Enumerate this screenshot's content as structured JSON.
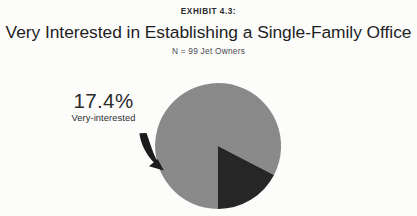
{
  "header": {
    "exhibit_label": "EXHIBIT 4.3:",
    "title": "Very Interested in Establishing a Single-Family Office",
    "sample_size": "N = 99 Jet Owners"
  },
  "callout": {
    "value": "17.4%",
    "name": "Very-interested"
  },
  "colors": {
    "slice_highlight": "#262626",
    "slice_remainder": "#8a8a8a",
    "background": "#fdfdfc",
    "text": "#222222",
    "leader": "#1c1c1c"
  },
  "chart_data": {
    "type": "pie",
    "title": "Very Interested in Establishing a Single-Family Office",
    "subtitle": "N = 99 Jet Owners",
    "exhibit": "EXHIBIT 4.3:",
    "categories": [
      "Very-interested",
      "Not very-interested"
    ],
    "values": [
      17.4,
      82.6
    ],
    "value_labels": [
      "17.4%",
      ""
    ],
    "colors": [
      "#262626",
      "#8a8a8a"
    ],
    "labelled_slices": [
      "Very-interested"
    ],
    "legend": false,
    "legend_position": "none",
    "grid": false,
    "units": "percent",
    "total": 100,
    "n": 99,
    "start_angle_deg": 180,
    "direction": "counterclockwise",
    "annotations": [
      {
        "text": "17.4%",
        "subtext": "Very-interested",
        "target_slice": "Very-interested",
        "leader": "curved-arrow"
      }
    ],
    "geometry": {
      "center_x": 218,
      "center_y": 146,
      "radius": 63
    }
  }
}
